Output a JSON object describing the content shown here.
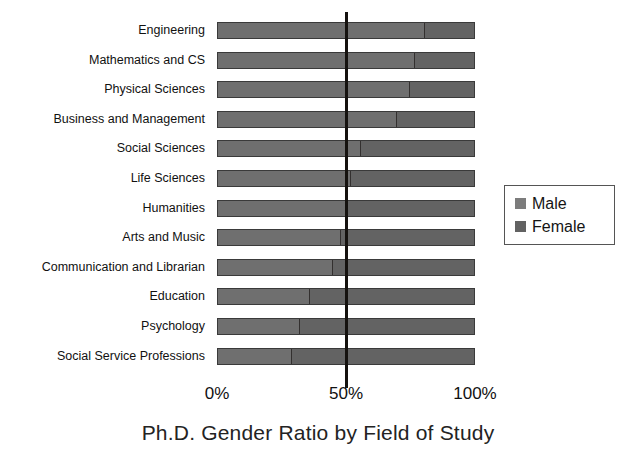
{
  "chart_data": {
    "type": "bar",
    "orientation": "horizontal",
    "stacked": true,
    "stack_mode": "percent",
    "title": "Ph.D. Gender Ratio by Field of Study",
    "xlabel": "",
    "ylabel": "",
    "xlim": [
      0,
      100
    ],
    "xticks": [
      0,
      50,
      100
    ],
    "xtick_labels": [
      "0%",
      "50%",
      "100%"
    ],
    "grid": false,
    "reference_line": {
      "value": 50,
      "label": "50%",
      "color": "#15120f"
    },
    "legend": {
      "position": "right",
      "entries": [
        {
          "name": "Male",
          "color": "#7c7c7c"
        },
        {
          "name": "Female",
          "color": "#626262"
        }
      ]
    },
    "categories": [
      "Engineering",
      "Mathematics and CS",
      "Physical Sciences",
      "Business and Management",
      "Social Sciences",
      "Life Sciences",
      "Humanities",
      "Arts and Music",
      "Communication and Librarian",
      "Education",
      "Psychology",
      "Social Service Professions"
    ],
    "series": [
      {
        "name": "Male",
        "color": "#6f6f6f",
        "values": [
          81,
          77,
          75,
          70,
          56,
          52,
          50,
          48,
          45,
          36,
          32,
          29
        ]
      },
      {
        "name": "Female",
        "color": "#636363",
        "values": [
          19,
          23,
          25,
          30,
          44,
          48,
          50,
          52,
          55,
          64,
          68,
          71
        ]
      }
    ]
  }
}
